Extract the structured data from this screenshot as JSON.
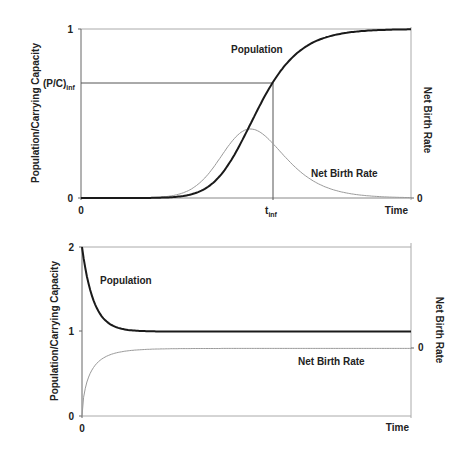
{
  "chart_data": [
    {
      "type": "line",
      "title": "",
      "xlabel": "Time",
      "ylabel": "Population/Carrying Capacity",
      "ylabel_right": "Net Birth Rate",
      "ylim": [
        0,
        1
      ],
      "grid": false,
      "y_ticks": [
        "0",
        "(P/C)",
        "1"
      ],
      "y_tick_inf_subscript": "inf",
      "y_inf_value": 0.68,
      "x_ticks": [
        "0",
        "t",
        "Time"
      ],
      "x_tick_inf_subscript": "inf",
      "right_ticks": [
        "0"
      ],
      "series": [
        {
          "name": "Population",
          "style": "thick-dark",
          "curve": "logistic",
          "t_inf_frac": 0.58,
          "value_at_tinf": 0.68,
          "x": [
            0,
            0.1,
            0.2,
            0.3,
            0.4,
            0.5,
            0.58,
            0.65,
            0.7,
            0.8,
            0.9,
            1.0
          ],
          "values": [
            0.01,
            0.03,
            0.06,
            0.12,
            0.24,
            0.44,
            0.68,
            0.86,
            0.94,
            0.99,
            1.0,
            1.0
          ]
        },
        {
          "name": "Net Birth Rate",
          "style": "thin-gray",
          "curve": "bell",
          "peak_frac": 0.58,
          "x": [
            0,
            0.1,
            0.2,
            0.3,
            0.4,
            0.5,
            0.58,
            0.65,
            0.7,
            0.8,
            0.9,
            1.0
          ],
          "values": [
            0.01,
            0.02,
            0.05,
            0.1,
            0.19,
            0.35,
            0.41,
            0.3,
            0.17,
            0.03,
            0.0,
            0.0
          ]
        }
      ],
      "annotations": [
        "Population",
        "Net Birth Rate"
      ]
    },
    {
      "type": "line",
      "title": "",
      "xlabel": "Time",
      "ylabel": "Population/Carrying Capacity",
      "ylabel_right": "Net Birth Rate",
      "ylim": [
        0,
        2
      ],
      "grid": false,
      "y_ticks": [
        "0",
        "1",
        "2"
      ],
      "x_ticks": [
        "0",
        "Time"
      ],
      "right_ticks": [
        "0"
      ],
      "series": [
        {
          "name": "Population",
          "style": "thick-dark",
          "x": [
            0,
            0.02,
            0.05,
            0.1,
            0.15,
            0.2,
            0.3,
            1.0
          ],
          "values": [
            2.0,
            1.5,
            1.2,
            1.05,
            1.01,
            1.0,
            1.0,
            1.0
          ]
        },
        {
          "name": "Net Birth Rate",
          "style": "thin-gray",
          "note": "rises from below to asymptote at right-axis zero",
          "x": [
            0,
            0.01,
            0.03,
            0.06,
            0.1,
            0.2,
            1.0
          ],
          "values": [
            0,
            0.4,
            0.65,
            0.75,
            0.79,
            0.8,
            0.8
          ]
        }
      ],
      "annotations": [
        "Population",
        "Net Birth Rate"
      ]
    }
  ],
  "top": {
    "ylabel": "Population/Carrying Capacity",
    "ylabel_right": "Net Birth Rate",
    "tick_1": "1",
    "tick_0": "0",
    "tick_inf": "(P/C)",
    "tick_inf_sub": "inf",
    "x_0": "0",
    "x_tinf": "t",
    "x_tinf_sub": "inf",
    "x_time": "Time",
    "right_0": "0",
    "label_population": "Population",
    "label_birth": "Net Birth Rate"
  },
  "bottom": {
    "ylabel": "Population/Carrying Capacity",
    "ylabel_right": "Net Birth Rate",
    "tick_2": "2",
    "tick_1": "1",
    "tick_0": "0",
    "x_0": "0",
    "x_time": "Time",
    "right_0": "0",
    "label_population": "Population",
    "label_birth": "Net Birth Rate"
  },
  "colors": {
    "population": "#1a1a1a",
    "birth": "#9a9a9a",
    "axis": "#666666",
    "frame": "#aaaaaa"
  }
}
